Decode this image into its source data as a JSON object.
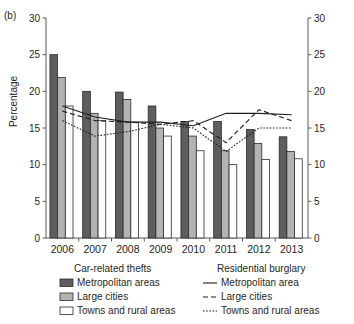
{
  "panel": {
    "label": "(b)"
  },
  "axes": {
    "ylabel": "Percentage",
    "y_ticks": [
      "0",
      "5",
      "10",
      "15",
      "20",
      "25",
      "30"
    ],
    "y_ticks_right": [
      "0",
      "5",
      "10",
      "15",
      "20",
      "25",
      "30"
    ],
    "x_ticks": [
      "2006",
      "2007",
      "2008",
      "2009",
      "2010",
      "2011",
      "2012",
      "2013"
    ]
  },
  "legend": {
    "left_title": "Car-related thefts",
    "right_title": "Residential burglary",
    "bars": [
      {
        "label": "Metropolitan areas",
        "swatch": "dark-gray-swatch",
        "color": "#5e5e5e"
      },
      {
        "label": "Large cities",
        "swatch": "light-gray-swatch",
        "color": "#b3b3b3"
      },
      {
        "label": "Towns and rural areas",
        "swatch": "white-swatch",
        "color": "#fdfdfd"
      }
    ],
    "lines": [
      {
        "label": "Metropolitan area",
        "style": "solid-line-swatch"
      },
      {
        "label": "Large cities",
        "style": "dashed-line-swatch"
      },
      {
        "label": "Towns and rural areas",
        "style": "dotted-line-swatch"
      }
    ]
  },
  "chart_data": {
    "type": "bar",
    "title": "",
    "subtitle": "",
    "xlabel": "",
    "ylabel": "Percentage",
    "ylim": [
      0,
      30
    ],
    "ytick_step": 5,
    "grid": false,
    "legend_position": "below",
    "dual_axis": true,
    "categories": [
      "2006",
      "2007",
      "2008",
      "2009",
      "2010",
      "2011",
      "2012",
      "2013"
    ],
    "series": [
      {
        "name": "Car-related thefts – Metropolitan areas",
        "kind": "bar",
        "color": "#5e5e5e",
        "values": [
          25.0,
          20.0,
          19.9,
          18.0,
          15.9,
          15.9,
          14.8,
          13.8
        ]
      },
      {
        "name": "Car-related thefts – Large cities",
        "kind": "bar",
        "color": "#b3b3b3",
        "values": [
          21.9,
          17.0,
          18.9,
          15.0,
          13.9,
          11.9,
          12.9,
          11.8
        ]
      },
      {
        "name": "Car-related thefts – Towns and rural areas",
        "kind": "bar",
        "color": "#fdfdfd",
        "values": [
          18.0,
          16.0,
          15.8,
          13.9,
          11.9,
          10.0,
          10.7,
          10.8
        ]
      },
      {
        "name": "Residential burglary – Metropolitan area",
        "kind": "line",
        "style": "solid",
        "values": [
          18.0,
          16.5,
          15.8,
          15.8,
          15.3,
          17.0,
          17.0,
          16.8
        ]
      },
      {
        "name": "Residential burglary – Large cities",
        "kind": "line",
        "style": "dashed",
        "values": [
          17.3,
          16.0,
          15.8,
          15.5,
          16.0,
          13.0,
          17.5,
          16.0
        ]
      },
      {
        "name": "Residential burglary – Towns and rural areas",
        "kind": "line",
        "style": "dotted",
        "values": [
          16.0,
          13.9,
          14.5,
          15.5,
          15.0,
          11.8,
          15.0,
          15.0
        ]
      }
    ]
  }
}
